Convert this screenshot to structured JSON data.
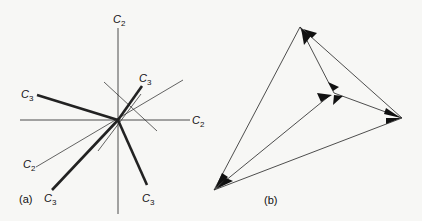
{
  "panel_a": {
    "caption": "(a)",
    "labels": {
      "c2_top": {
        "main": "C",
        "sub": "2"
      },
      "c2_right": {
        "main": "C",
        "sub": "2"
      },
      "c2_lower_left": {
        "main": "C",
        "sub": "2"
      },
      "c3_upper_right": {
        "main": "C",
        "sub": "3"
      },
      "c3_left": {
        "main": "C",
        "sub": "3"
      },
      "c3_lower_left": {
        "main": "C",
        "sub": "3"
      },
      "c3_lower_right": {
        "main": "C",
        "sub": "3"
      }
    }
  },
  "panel_b": {
    "caption": "(b)"
  },
  "colors": {
    "background": "#f7f7f5",
    "ink": "#111111"
  }
}
